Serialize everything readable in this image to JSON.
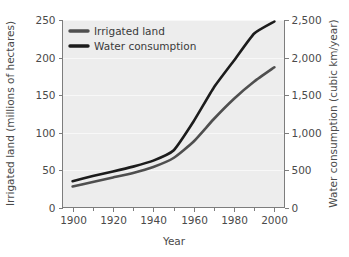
{
  "chart_data": {
    "type": "line",
    "title": "",
    "xlabel": "Year",
    "ylabel": "Irrigated land (millions of hectares)",
    "y2label": "Water consumption (cubic km/year)",
    "grid": true,
    "legend_position": "top-left",
    "xlim": [
      1895,
      2005
    ],
    "ylim": [
      0,
      250
    ],
    "y2lim": [
      0,
      2500
    ],
    "xticks": [
      1900,
      1920,
      1940,
      1960,
      1980,
      2000
    ],
    "xtick_labels": [
      "1900",
      "1920",
      "1940",
      "1960",
      "1980",
      "2000"
    ],
    "xminor_ticks": [
      1910,
      1930,
      1950,
      1970,
      1990
    ],
    "yticks": [
      0,
      50,
      100,
      150,
      200,
      250
    ],
    "ytick_labels": [
      "0",
      "50",
      "100",
      "150",
      "200",
      "250"
    ],
    "y2ticks": [
      0,
      500,
      1000,
      1500,
      2000,
      2500
    ],
    "y2tick_labels": [
      "0",
      "500",
      "1,000",
      "1,500",
      "2,000",
      "2,500"
    ],
    "x": [
      1900,
      1910,
      1920,
      1930,
      1940,
      1950,
      1960,
      1970,
      1980,
      1990,
      2000
    ],
    "series": [
      {
        "name": "Irrigated land",
        "axis": "left",
        "color": "#4f4f4f",
        "width": 2.6,
        "units": "millions of hectares",
        "values": [
          28,
          34,
          40,
          46,
          54,
          66,
          88,
          118,
          145,
          168,
          187
        ]
      },
      {
        "name": "Water consumption",
        "axis": "right",
        "color": "#1c1c1c",
        "width": 2.6,
        "units": "cubic km/year",
        "values": [
          350,
          420,
          480,
          545,
          625,
          760,
          1150,
          1600,
          1960,
          2320,
          2480
        ]
      }
    ],
    "colors": {
      "plot_background": "#ededed",
      "gridline": "#f8f8f8",
      "axis": "#7d7d7d",
      "text": "#4a4a4a",
      "page_background": "#ffffff"
    }
  },
  "legend": {
    "items": [
      {
        "label": "Irrigated land"
      },
      {
        "label": "Water consumption"
      }
    ]
  }
}
